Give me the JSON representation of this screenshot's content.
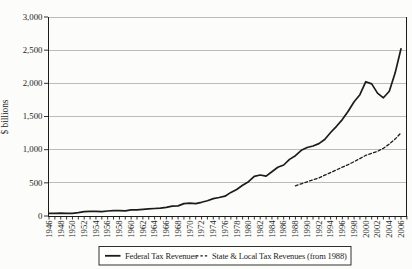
{
  "colors": {
    "ink": "#1c1c1c",
    "grid": "#b4b4b4",
    "paper": "#fcfcfa"
  },
  "chart_data": {
    "type": "line",
    "title": "",
    "ylabel": "$ billions",
    "ylim": [
      0,
      3000
    ],
    "ytick_step": 500,
    "ytick_labels": [
      "0",
      "500",
      "1,000",
      "1,500",
      "2,000",
      "2,500",
      "3,000"
    ],
    "x_start": 1946,
    "x_end": 2006,
    "x_minor_tick_every": 1,
    "x_label_every": 2,
    "xtick_labels": [
      "1946",
      "1948",
      "1950",
      "1952",
      "1954",
      "1956",
      "1958",
      "1960",
      "1962",
      "1964",
      "1966",
      "1968",
      "1970",
      "1972",
      "1974",
      "1976",
      "1978",
      "1980",
      "1982",
      "1984",
      "1986",
      "1988",
      "1990",
      "1992",
      "1994",
      "1996",
      "1998",
      "2000",
      "2002",
      "2004",
      "2006"
    ],
    "grid": "horizontal-gridlines",
    "legend_position": "bottom",
    "series": [
      {
        "name": "Federal Tax Revenues",
        "style": "solid",
        "x_start": 1946,
        "values": [
          40,
          39,
          42,
          39,
          39,
          52,
          66,
          70,
          70,
          66,
          75,
          80,
          80,
          79,
          93,
          94,
          100,
          107,
          113,
          117,
          131,
          149,
          153,
          187,
          193,
          187,
          207,
          231,
          263,
          279,
          298,
          356,
          400,
          463,
          517,
          599,
          618,
          601,
          666,
          734,
          769,
          854,
          909,
          991,
          1032,
          1055,
          1091,
          1154,
          1259,
          1352,
          1453,
          1579,
          1722,
          1828,
          2025,
          1991,
          1853,
          1782,
          1880,
          2154,
          2520
        ]
      },
      {
        "name": "State & Local Tax Revenues (from 1988)",
        "style": "dashed",
        "x_start": 1988,
        "values": [
          455,
          485,
          515,
          545,
          575,
          615,
          655,
          695,
          735,
          775,
          820,
          865,
          915,
          945,
          975,
          1020,
          1085,
          1160,
          1255
        ]
      }
    ]
  }
}
